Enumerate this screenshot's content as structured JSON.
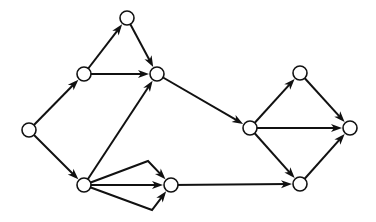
{
  "diagram": {
    "type": "directed-graph",
    "background": "#ffffff",
    "stroke_color": "#111111",
    "node_radius": 7,
    "nodes": [
      {
        "id": "A",
        "x": 29,
        "y": 130
      },
      {
        "id": "B",
        "x": 84,
        "y": 74
      },
      {
        "id": "C",
        "x": 127,
        "y": 18
      },
      {
        "id": "D",
        "x": 157,
        "y": 74
      },
      {
        "id": "E",
        "x": 84,
        "y": 185
      },
      {
        "id": "F",
        "x": 171,
        "y": 185
      },
      {
        "id": "G",
        "x": 250,
        "y": 128
      },
      {
        "id": "H",
        "x": 300,
        "y": 73
      },
      {
        "id": "I",
        "x": 350,
        "y": 128
      },
      {
        "id": "J",
        "x": 300,
        "y": 184
      }
    ],
    "edges": [
      {
        "from": "A",
        "to": "B"
      },
      {
        "from": "A",
        "to": "E"
      },
      {
        "from": "B",
        "to": "C"
      },
      {
        "from": "B",
        "to": "D"
      },
      {
        "from": "C",
        "to": "D"
      },
      {
        "from": "E",
        "to": "D"
      },
      {
        "from": "E",
        "to": "F",
        "via": [
          148,
          161
        ]
      },
      {
        "from": "E",
        "to": "F"
      },
      {
        "from": "E",
        "to": "F",
        "via": [
          152,
          210
        ]
      },
      {
        "from": "D",
        "to": "G"
      },
      {
        "from": "F",
        "to": "J"
      },
      {
        "from": "G",
        "to": "H"
      },
      {
        "from": "G",
        "to": "I"
      },
      {
        "from": "G",
        "to": "J"
      },
      {
        "from": "H",
        "to": "I"
      },
      {
        "from": "J",
        "to": "I"
      }
    ]
  }
}
